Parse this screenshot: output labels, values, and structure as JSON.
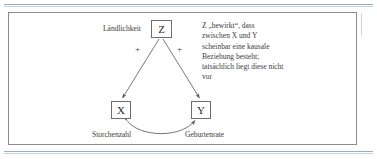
{
  "figure": {
    "nodes": [
      {
        "id": "z",
        "label": "Z",
        "caption": "Ländlichkeit"
      },
      {
        "id": "x",
        "label": "X",
        "caption": "Storchenzahl"
      },
      {
        "id": "y",
        "label": "Y",
        "caption": "Geburtenrate"
      }
    ],
    "edge_signs": {
      "z_to_x": "+",
      "z_to_y": "+"
    },
    "note": "Z „bewirkt“, dass zwischen X und Y scheinbar eine kausale Beziehung besteht; tatsächlich liegt diese nicht vor",
    "colors": {
      "frame_border": "#8b8b8b",
      "node_border": "#6e6e6e",
      "arrow": "#555555",
      "text": "#3a3a3a",
      "page_rule": "#9aaec6",
      "background": "#ffffff"
    }
  }
}
